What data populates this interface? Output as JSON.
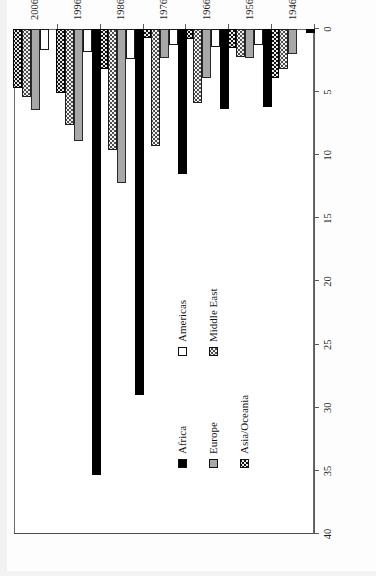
{
  "chart_data": {
    "type": "bar",
    "orientation": "horizontal-grouped-rotated",
    "title": "",
    "xlabel": "",
    "ylabel": "",
    "value_axis": {
      "ticks": [
        0,
        5,
        10,
        15,
        20,
        25,
        30,
        35,
        40
      ],
      "tick_labels": [
        "0",
        "5",
        "10",
        "15",
        "20",
        "25",
        "30",
        "35",
        "40"
      ],
      "range": [
        0,
        40
      ],
      "direction": "right-to-left",
      "grid": false
    },
    "categories": [
      "1946-1955",
      "1956-1965",
      "1966-1975",
      "1976-1985",
      "1986-1995",
      "1996-2005",
      "2006-2012"
    ],
    "legend_position": "inside-left-center",
    "series": [
      {
        "name": "Africa",
        "color": "#000000",
        "pattern": "solid-black",
        "values": [
          0.3,
          6.2,
          6.3,
          11.5,
          29.0,
          35.3,
          0.0
        ]
      },
      {
        "name": "Americas",
        "color": "#ffffff",
        "pattern": "open-white",
        "values": [
          0.0,
          1.3,
          1.4,
          1.3,
          2.4,
          1.8,
          1.7
        ]
      },
      {
        "name": "Europe",
        "color": "#a8a8a8",
        "pattern": "solid-gray",
        "values": [
          2.0,
          2.3,
          3.9,
          2.3,
          12.2,
          8.9,
          6.4
        ]
      },
      {
        "name": "Middle East",
        "color": "#f2f2f2",
        "pattern": "light-dotted",
        "values": [
          3.2,
          2.2,
          5.9,
          9.3,
          9.6,
          7.6,
          5.4
        ]
      },
      {
        "name": "Asia/Oceania",
        "color": "#131313",
        "pattern": "dark-dotted",
        "values": [
          3.9,
          1.5,
          0.8,
          0.7,
          3.2,
          5.1,
          4.7
        ]
      }
    ]
  },
  "legend": {
    "items": [
      {
        "label": "Africa",
        "swatch": "africa-swatch"
      },
      {
        "label": "Americas",
        "swatch": "americas-swatch"
      },
      {
        "label": "Europe",
        "swatch": "europe-swatch"
      },
      {
        "label": "Middle East",
        "swatch": "middle-east-swatch"
      },
      {
        "label": "Asia/Oceania",
        "swatch": "asia-oceania-swatch"
      }
    ]
  }
}
